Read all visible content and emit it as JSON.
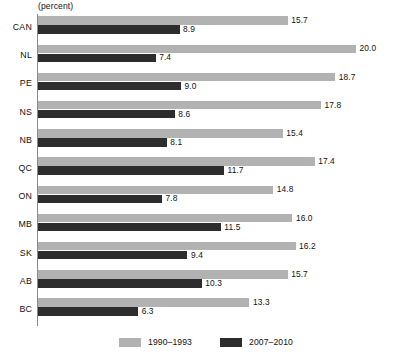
{
  "chart_data": {
    "type": "bar",
    "orientation": "horizontal",
    "title": "",
    "subtitle": "",
    "xlabel": "(percent)",
    "ylabel": "",
    "axis_unit": "(percent)",
    "grid": false,
    "legend_position": "bottom-center",
    "xlim": [
      0,
      20.0
    ],
    "categories": [
      "CAN",
      "NL",
      "PE",
      "NS",
      "NB",
      "QC",
      "ON",
      "MB",
      "SK",
      "AB",
      "BC"
    ],
    "series": [
      {
        "name": "1990–1993",
        "color": "#b2b2b2",
        "values": [
          15.7,
          20.0,
          18.7,
          17.8,
          15.4,
          17.4,
          14.8,
          16.0,
          16.2,
          15.7,
          13.3
        ],
        "labels": [
          "15.7",
          "20.0",
          "18.7",
          "17.8",
          "15.4",
          "17.4",
          "14.8",
          "16.0",
          "16.2",
          "15.7",
          "13.3"
        ]
      },
      {
        "name": "2007–2010",
        "color": "#2d2d2d",
        "values": [
          8.9,
          7.4,
          9.0,
          8.6,
          8.1,
          11.7,
          7.8,
          11.5,
          9.4,
          10.3,
          6.3
        ],
        "labels": [
          "8.9",
          "7.4",
          "9.0",
          "8.6",
          "8.1",
          "11.7",
          "7.8",
          "11.5",
          "9.4",
          "10.3",
          "6.3"
        ]
      }
    ]
  },
  "legend": {
    "entries": [
      {
        "label": "1990–1993"
      },
      {
        "label": "2007–2010"
      }
    ]
  },
  "footnote": {
    "text": ""
  }
}
